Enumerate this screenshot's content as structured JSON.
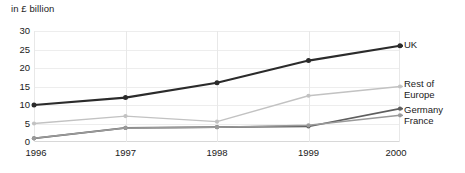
{
  "chart_data": {
    "type": "line",
    "title": "in £ billion",
    "xlabel": "",
    "ylabel": "in £ billion",
    "x": [
      "1996",
      "1997",
      "1998",
      "1999",
      "2000"
    ],
    "categories": [
      "1996",
      "1997",
      "1998",
      "1999",
      "2000"
    ],
    "yticks": [
      "0",
      "5",
      "10",
      "15",
      "20",
      "25",
      "30"
    ],
    "ylim": [
      0,
      30
    ],
    "grid": true,
    "legend_position": "right-of-plot-inline",
    "markers": "filled-circle",
    "series": [
      {
        "name": "UK",
        "label": "UK",
        "values": [
          10,
          12,
          16,
          22,
          26
        ],
        "color": "#2b2b2b",
        "width": 2.1
      },
      {
        "name": "Rest of Europe",
        "label_line1": "Rest of",
        "label_line2": "Europe",
        "values": [
          5,
          7,
          5.5,
          12.5,
          15
        ],
        "color": "#c2c2c2",
        "width": 1.4
      },
      {
        "name": "Germany",
        "label": "Germany",
        "values": [
          1,
          3.8,
          4,
          4.2,
          9
        ],
        "color": "#5e5e5e",
        "width": 1.7
      },
      {
        "name": "France",
        "label": "France",
        "values": [
          1,
          3.8,
          4,
          4.5,
          7.2
        ],
        "color": "#9a9a9a",
        "width": 1.5
      }
    ]
  }
}
